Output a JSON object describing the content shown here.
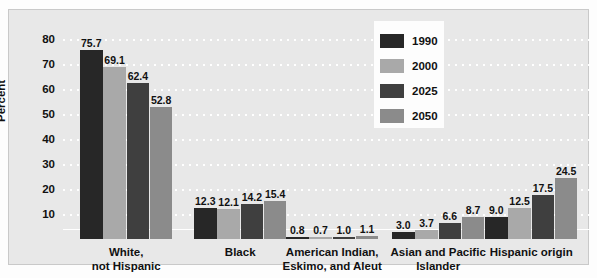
{
  "chart_data": {
    "type": "bar",
    "title": "",
    "xlabel": "",
    "ylabel": "Percent",
    "ylim": [
      0,
      85
    ],
    "yticks": [
      10,
      20,
      30,
      40,
      50,
      60,
      70,
      80
    ],
    "ytick_labels": [
      "10",
      "20",
      "30",
      "40",
      "50",
      "60",
      "70",
      "80"
    ],
    "grid": true,
    "legend_position": "top-right",
    "categories": [
      "White,\nnot Hispanic",
      "Black",
      "American Indian,\nEskimo, and Aleut",
      "Asian and Pacific\nIslander",
      "Hispanic origin"
    ],
    "category_lines": [
      [
        "White,",
        "not Hispanic"
      ],
      [
        "Black"
      ],
      [
        "American Indian,",
        "Eskimo, and Aleut"
      ],
      [
        "Asian and Pacific",
        "Islander"
      ],
      [
        "Hispanic origin"
      ]
    ],
    "series": [
      {
        "name": "1990",
        "color": "#272727",
        "values": [
          75.7,
          12.3,
          0.8,
          3.0,
          9.0
        ]
      },
      {
        "name": "2000",
        "color": "#a9a9a9",
        "values": [
          69.1,
          12.1,
          0.7,
          3.7,
          12.5
        ]
      },
      {
        "name": "2025",
        "color": "#3f3f3f",
        "values": [
          62.4,
          14.2,
          1.0,
          6.6,
          17.5
        ]
      },
      {
        "name": "2050",
        "color": "#8b8b8b",
        "values": [
          52.8,
          15.4,
          1.1,
          8.7,
          24.5
        ]
      }
    ],
    "value_labels": [
      [
        "75.7",
        "69.1",
        "62.4",
        "52.8"
      ],
      [
        "12.3",
        "12.1",
        "14.2",
        "15.4"
      ],
      [
        "0.8",
        "0.7",
        "1.0",
        "1.1"
      ],
      [
        "3.0",
        "3.7",
        "6.6",
        "8.7"
      ],
      [
        "9.0",
        "12.5",
        "17.5",
        "24.5"
      ]
    ]
  },
  "legend": {
    "entries": [
      {
        "label": "1990",
        "color": "#272727"
      },
      {
        "label": "2000",
        "color": "#a9a9a9"
      },
      {
        "label": "2025",
        "color": "#3f3f3f"
      },
      {
        "label": "2050",
        "color": "#8b8b8b"
      }
    ]
  },
  "colors": {
    "panel_background": "#e8e8e8",
    "figure_background": "#fdfdfd",
    "gridline": "#ffffff",
    "text": "#111111"
  }
}
